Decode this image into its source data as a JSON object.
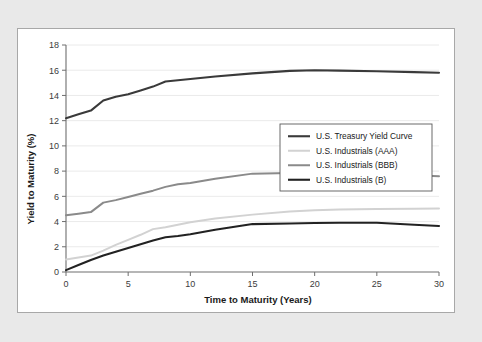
{
  "figure": {
    "panel_background": "#ffffff",
    "page_background": "#e9e9e9",
    "border_color": "#a8a8a8"
  },
  "chart_data": {
    "type": "line",
    "title": "",
    "xlabel": "Time to Maturity (Years)",
    "ylabel": "Yield to Maturity (%)",
    "xlim": [
      0,
      30
    ],
    "ylim": [
      0,
      18
    ],
    "xticks": [
      0,
      5,
      10,
      15,
      20,
      25,
      30
    ],
    "yticks": [
      0,
      2,
      4,
      6,
      8,
      10,
      12,
      14,
      16,
      18
    ],
    "grid": "horizontal",
    "legend_position": "center-right",
    "x": [
      0,
      1,
      2,
      3,
      4,
      5,
      6,
      7,
      8,
      9,
      10,
      12,
      15,
      18,
      20,
      22,
      25,
      28,
      30
    ],
    "series": [
      {
        "name": "U.S. Treasury Yield Curve",
        "color": "#3a3a3a",
        "width": 2.1,
        "values": [
          12.2,
          12.5,
          12.8,
          13.6,
          13.9,
          14.1,
          14.4,
          14.7,
          15.1,
          15.2,
          15.3,
          15.5,
          15.75,
          15.95,
          16.0,
          15.97,
          15.92,
          15.85,
          15.8
        ]
      },
      {
        "name": "U.S. Industrials (AAA)",
        "color": "#d2d2d2",
        "width": 2.0,
        "values": [
          1.0,
          1.15,
          1.3,
          1.7,
          2.15,
          2.55,
          2.95,
          3.4,
          3.55,
          3.75,
          3.95,
          4.25,
          4.55,
          4.8,
          4.9,
          4.95,
          5.0,
          5.02,
          5.03
        ]
      },
      {
        "name": "U.S. Industrials (BBB)",
        "color": "#8a8a8a",
        "width": 2.0,
        "values": [
          4.5,
          4.62,
          4.75,
          5.5,
          5.7,
          5.95,
          6.2,
          6.45,
          6.75,
          6.95,
          7.05,
          7.4,
          7.8,
          7.85,
          7.85,
          7.82,
          7.78,
          7.68,
          7.6
        ]
      },
      {
        "name": "U.S. Industrials (B)",
        "color": "#222222",
        "width": 2.1,
        "values": [
          0.15,
          0.55,
          0.95,
          1.3,
          1.6,
          1.9,
          2.2,
          2.5,
          2.75,
          2.85,
          3.0,
          3.35,
          3.8,
          3.85,
          3.88,
          3.9,
          3.9,
          3.75,
          3.65
        ]
      }
    ]
  }
}
